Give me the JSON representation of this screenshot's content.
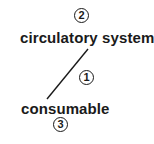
{
  "diagram": {
    "nodes": [
      {
        "id": "circulatory-system",
        "label": "circulatory system",
        "badge": "2"
      },
      {
        "id": "consumable",
        "label": "consumable",
        "badge": "3"
      }
    ],
    "edges": [
      {
        "from": "circulatory-system",
        "to": "consumable",
        "badge": "1"
      }
    ],
    "colors": {
      "text": "#1a1a1a",
      "line": "#1a1a1a",
      "background": "#ffffff"
    }
  }
}
